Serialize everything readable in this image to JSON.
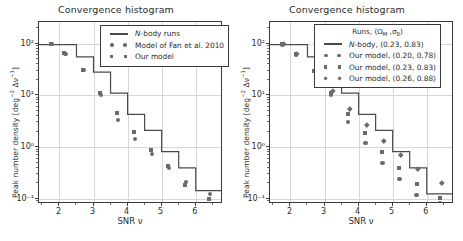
{
  "figure": {
    "width": 463,
    "height": 241,
    "background": "#ffffff",
    "marker_color": "#6b6b6b",
    "line_color": "#4a4a4a",
    "grid_color": "#d7d7d7"
  },
  "panels": [
    {
      "id": "left",
      "title": "Convergence histogram",
      "xlabel": "SNR ν",
      "ylabel": "Peak number density [deg⁻² Δν⁻¹]",
      "legend_title": "",
      "legend": [
        {
          "label": "N-body runs",
          "key": "line",
          "marker": "line"
        },
        {
          "label": "Model of Fan et al. 2010",
          "key": "markers",
          "marker": "circle"
        },
        {
          "label": "Our model",
          "key": "markers",
          "marker": "square"
        }
      ]
    },
    {
      "id": "right",
      "title": "Convergence histogram",
      "xlabel": "SNR ν",
      "ylabel": "Peak number density [deg⁻² Δν⁻¹]",
      "legend_title": "Runs, (Ω_M , σ₈)",
      "legend": [
        {
          "label": "N-body, (0.23, 0.83)",
          "key": "line",
          "marker": "line"
        },
        {
          "label": "Our model, (0.20, 0.78)",
          "key": "markers",
          "marker": "circle"
        },
        {
          "label": "Our model, (0.23, 0.83)",
          "key": "markers",
          "marker": "square"
        },
        {
          "label": "Our model, (0.26, 0.88)",
          "key": "markers",
          "marker": "diamond"
        }
      ]
    }
  ],
  "axes": {
    "xticks": [
      2,
      3,
      4,
      5,
      6
    ],
    "xtick_labels": [
      "2",
      "3",
      "4",
      "5",
      "6"
    ],
    "xlim": [
      1.4,
      6.8
    ],
    "yticks": [
      100,
      10,
      1,
      0.1
    ],
    "ytick_labels": [
      "10²",
      "10¹",
      "10⁰",
      "10⁻¹"
    ],
    "ylim": [
      0.08,
      260
    ]
  },
  "chart_data": [
    {
      "type": "line",
      "panel": "left",
      "title": "Convergence histogram",
      "xlabel": "SNR ν",
      "ylabel": "Peak number density [deg⁻² Δν⁻¹]",
      "xlim": [
        1.4,
        6.8
      ],
      "ylim": [
        0.08,
        260
      ],
      "yscale": "log",
      "grid": true,
      "legend_position": "upper right",
      "bin_edges": [
        1.4,
        1.95,
        2.5,
        3.0,
        3.5,
        4.0,
        4.5,
        5.0,
        5.5,
        6.0,
        6.8
      ],
      "bin_centers": [
        1.7,
        2.2,
        2.75,
        3.25,
        3.75,
        4.25,
        4.75,
        5.25,
        5.75,
        6.4
      ],
      "series": [
        {
          "name": "N-body runs",
          "style": "step",
          "marker": "line",
          "values": [
            95,
            95,
            55,
            28,
            11.0,
            4.3,
            2.1,
            0.82,
            0.4,
            0.145
          ]
        },
        {
          "name": "Model of Fan et al. 2010",
          "style": "markers",
          "marker": "circle",
          "x": [
            1.78,
            2.18,
            2.72,
            3.22,
            3.72,
            4.22,
            4.72,
            5.22,
            5.72,
            6.42
          ],
          "values": [
            98,
            62,
            30.5,
            10.2,
            3.4,
            1.45,
            0.75,
            0.4,
            0.215,
            0.125
          ]
        },
        {
          "name": "Our model",
          "style": "markers",
          "marker": "square",
          "x": [
            1.74,
            2.14,
            2.68,
            3.18,
            3.68,
            4.18,
            4.68,
            5.18,
            5.68,
            6.38
          ],
          "values": [
            100,
            66,
            31.5,
            11.0,
            4.5,
            2.0,
            0.88,
            0.43,
            0.185,
            0.098
          ]
        }
      ]
    },
    {
      "type": "line",
      "panel": "right",
      "title": "Convergence histogram",
      "xlabel": "SNR ν",
      "ylabel": "Peak number density [deg⁻² Δν⁻¹]",
      "xlim": [
        1.4,
        6.8
      ],
      "ylim": [
        0.08,
        260
      ],
      "yscale": "log",
      "grid": true,
      "legend_position": "upper right",
      "legend_title": "Runs, (Ω_M , σ₈)",
      "bin_edges": [
        1.4,
        1.95,
        2.5,
        3.0,
        3.5,
        4.0,
        4.5,
        5.0,
        5.5,
        6.0,
        6.8
      ],
      "bin_centers": [
        1.7,
        2.2,
        2.75,
        3.25,
        3.75,
        4.25,
        4.75,
        5.25,
        5.75,
        6.4
      ],
      "series": [
        {
          "name": "N-body, (0.23, 0.83)",
          "style": "step",
          "marker": "line",
          "values": [
            95,
            95,
            55,
            28,
            11.0,
            4.3,
            2.1,
            0.82,
            0.4,
            0.125
          ]
        },
        {
          "name": "Our model, (0.20, 0.78)",
          "style": "markers",
          "marker": "circle",
          "x": [
            1.76,
            2.16,
            2.7,
            3.2,
            3.7,
            4.2,
            4.7,
            5.2,
            5.7,
            6.4
          ],
          "values": [
            95,
            60,
            29,
            10.0,
            3.1,
            1.2,
            0.5,
            0.245,
            0.118,
            0.085
          ]
        },
        {
          "name": "Our model, (0.23, 0.83)",
          "style": "markers",
          "marker": "square",
          "x": [
            1.76,
            2.16,
            2.7,
            3.2,
            3.7,
            4.2,
            4.7,
            5.2,
            5.7,
            6.4
          ],
          "values": [
            97,
            62,
            30,
            11.0,
            4.3,
            1.85,
            0.82,
            0.405,
            0.195,
            0.105
          ]
        },
        {
          "name": "Our model, (0.26, 0.88)",
          "style": "markers",
          "marker": "diamond",
          "x": [
            1.8,
            2.2,
            2.74,
            3.24,
            3.74,
            4.24,
            4.74,
            5.24,
            5.74,
            6.44
          ],
          "values": [
            100,
            64,
            31,
            12.5,
            5.4,
            2.7,
            1.3,
            0.72,
            0.375,
            0.205
          ]
        }
      ]
    }
  ]
}
